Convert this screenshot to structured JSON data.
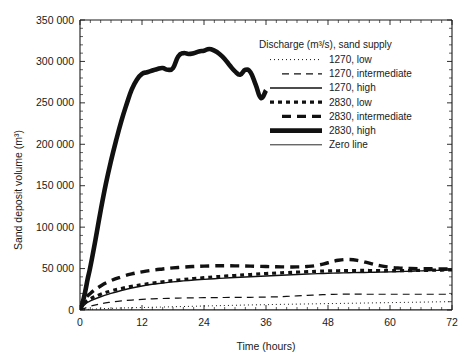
{
  "chart_data": {
    "type": "line",
    "title": "",
    "xlabel": "Time (hours)",
    "ylabel": "Sand deposit volume (m³)",
    "xlim": [
      0,
      72
    ],
    "ylim": [
      0,
      350000
    ],
    "xticks": [
      0,
      12,
      24,
      36,
      48,
      60,
      72
    ],
    "xtick_labels": [
      "0",
      "12",
      "24",
      "36",
      "48",
      "60",
      "72"
    ],
    "yticks": [
      0,
      50000,
      100000,
      150000,
      200000,
      250000,
      300000,
      350000
    ],
    "ytick_labels": [
      "0",
      "50 000",
      "100 000",
      "150 000",
      "200 000",
      "250 000",
      "300 000",
      "350 000"
    ],
    "x_minor_tick_interval": 2,
    "y_minor_tick_interval": 10000,
    "grid": false,
    "legend_position": "upper right",
    "legend_title": "Discharge (m³/s), sand supply",
    "series": [
      {
        "name": "1270, low",
        "style": "fine-dotted",
        "linewidth": 1.0,
        "dasharray": "1,3",
        "x": [
          0,
          2,
          4,
          6,
          8,
          10,
          12,
          14,
          16,
          18,
          20,
          22,
          24,
          26,
          28,
          30,
          32,
          34,
          36,
          38,
          40,
          42,
          44,
          46,
          48,
          50,
          52,
          54,
          56,
          58,
          60,
          62,
          64,
          66,
          68,
          70,
          72
        ],
        "y": [
          0,
          900,
          1500,
          2000,
          2400,
          2700,
          3000,
          3300,
          3600,
          3900,
          4200,
          4500,
          4800,
          5100,
          5400,
          5700,
          6000,
          6200,
          6400,
          6700,
          6900,
          7100,
          7300,
          7500,
          7700,
          7900,
          8100,
          8300,
          8500,
          8700,
          8900,
          9100,
          9300,
          9500,
          9700,
          9900,
          10000
        ]
      },
      {
        "name": "1270, intermediate",
        "style": "dashed",
        "linewidth": 1.2,
        "dasharray": "7,5",
        "x": [
          0,
          2,
          4,
          6,
          8,
          10,
          12,
          14,
          16,
          18,
          20,
          22,
          24,
          26,
          28,
          30,
          32,
          34,
          36,
          38,
          40,
          42,
          44,
          46,
          48,
          50,
          52,
          54,
          56,
          58,
          60,
          62,
          64,
          66,
          68,
          70,
          72
        ],
        "y": [
          0,
          4500,
          7500,
          9500,
          11000,
          12000,
          12800,
          13400,
          13900,
          14200,
          14500,
          14700,
          14900,
          15000,
          15100,
          15200,
          15300,
          15400,
          15600,
          15900,
          16400,
          17000,
          17600,
          18200,
          18700,
          19000,
          19100,
          19100,
          19000,
          19000,
          19000,
          19000,
          19000,
          19000,
          19000,
          19000,
          19000
        ]
      },
      {
        "name": "1270, high",
        "style": "solid",
        "linewidth": 1.4,
        "dasharray": "",
        "x": [
          0,
          1,
          2,
          4,
          6,
          8,
          10,
          12,
          14,
          16,
          18,
          20,
          22,
          24,
          26,
          28,
          30,
          32,
          34,
          36,
          38,
          40,
          42,
          44,
          46,
          48,
          50,
          52,
          54,
          56,
          58,
          60,
          62,
          64,
          66,
          68,
          70,
          72
        ],
        "y": [
          0,
          7000,
          11000,
          16000,
          20000,
          23500,
          26500,
          29000,
          31000,
          32500,
          34000,
          35200,
          36200,
          37000,
          37800,
          38500,
          39200,
          39900,
          40500,
          41100,
          41700,
          42300,
          42900,
          43400,
          43900,
          44300,
          44700,
          45000,
          45200,
          45400,
          45700,
          46000,
          46400,
          46800,
          47200,
          47600,
          48000,
          48500
        ]
      },
      {
        "name": "2830, low",
        "style": "thick-dotted",
        "linewidth": 3.2,
        "dasharray": "4,4",
        "x": [
          0,
          1,
          2,
          4,
          6,
          8,
          10,
          12,
          14,
          16,
          18,
          20,
          22,
          24,
          26,
          28,
          30,
          32,
          34,
          36,
          38,
          40,
          42,
          44,
          46,
          48,
          50,
          52,
          54,
          56,
          58,
          60,
          62,
          64,
          66,
          68,
          70,
          72
        ],
        "y": [
          0,
          9000,
          13500,
          19000,
          23000,
          26000,
          28500,
          30500,
          32500,
          34000,
          35500,
          36800,
          38000,
          39000,
          40000,
          40800,
          41600,
          42400,
          43200,
          44000,
          44600,
          45200,
          45700,
          46200,
          46700,
          47100,
          47400,
          47600,
          47700,
          47700,
          47600,
          47500,
          47500,
          47600,
          47800,
          48000,
          48200,
          48500
        ]
      },
      {
        "name": "2830, intermediate",
        "style": "thick-dashed",
        "linewidth": 3.4,
        "dasharray": "9,6",
        "x": [
          0,
          1,
          2,
          4,
          6,
          8,
          10,
          12,
          14,
          16,
          18,
          20,
          22,
          24,
          26,
          28,
          30,
          32,
          34,
          36,
          38,
          40,
          42,
          44,
          46,
          48,
          50,
          52,
          54,
          56,
          58,
          60,
          62,
          64,
          66,
          68,
          70,
          72
        ],
        "y": [
          0,
          13000,
          20000,
          29000,
          35500,
          40000,
          43500,
          46000,
          48000,
          49500,
          50800,
          51800,
          52500,
          53000,
          53300,
          53400,
          53300,
          53100,
          52800,
          52500,
          52200,
          52000,
          52000,
          52500,
          54000,
          57000,
          60000,
          61000,
          59500,
          56500,
          53500,
          51500,
          50500,
          50000,
          49800,
          49700,
          49500,
          49500
        ]
      },
      {
        "name": "2830, high",
        "style": "very-thick-solid",
        "linewidth": 4.6,
        "dasharray": "",
        "x": [
          0,
          0.5,
          1,
          1.5,
          2,
          3,
          4,
          5,
          6,
          7,
          8,
          9,
          10,
          11,
          12,
          13,
          14,
          15,
          16,
          17,
          18,
          19,
          20,
          21,
          22,
          23,
          24,
          25,
          26,
          27,
          28,
          29,
          30,
          31,
          32,
          33,
          34,
          35,
          36
        ],
        "y": [
          0,
          9000,
          22000,
          38000,
          52000,
          85000,
          120000,
          152000,
          180000,
          205000,
          228000,
          248000,
          266000,
          278000,
          285000,
          287000,
          289000,
          291000,
          292000,
          290000,
          292000,
          306000,
          310000,
          309000,
          310000,
          312000,
          313000,
          315000,
          313000,
          309000,
          303000,
          295000,
          288000,
          284000,
          290000,
          287000,
          272000,
          256000,
          265000
        ]
      },
      {
        "name": "Zero line",
        "style": "thin-solid",
        "linewidth": 0.9,
        "dasharray": "",
        "x": [
          0,
          72
        ],
        "y": [
          0,
          0
        ]
      }
    ]
  },
  "legend": {
    "title": "Discharge (m³/s), sand supply",
    "entries": [
      {
        "label": "1270, low",
        "key": "1270-low"
      },
      {
        "label": "1270, intermediate",
        "key": "1270-intermediate"
      },
      {
        "label": "1270, high",
        "key": "1270-high"
      },
      {
        "label": "2830, low",
        "key": "2830-low"
      },
      {
        "label": "2830, intermediate",
        "key": "2830-intermediate"
      },
      {
        "label": "2830, high",
        "key": "2830-high"
      },
      {
        "label": "Zero line",
        "key": "zero-line"
      }
    ]
  },
  "axes": {
    "x_title": "Time (hours)",
    "y_title": "Sand deposit volume (m³)",
    "x_labels": [
      "0",
      "12",
      "24",
      "36",
      "48",
      "60",
      "72"
    ],
    "y_labels": [
      "0",
      "50 000",
      "100 000",
      "150 000",
      "200 000",
      "250 000",
      "300 000",
      "350 000"
    ]
  },
  "colors": {
    "ink": "#111111",
    "background": "#ffffff"
  }
}
